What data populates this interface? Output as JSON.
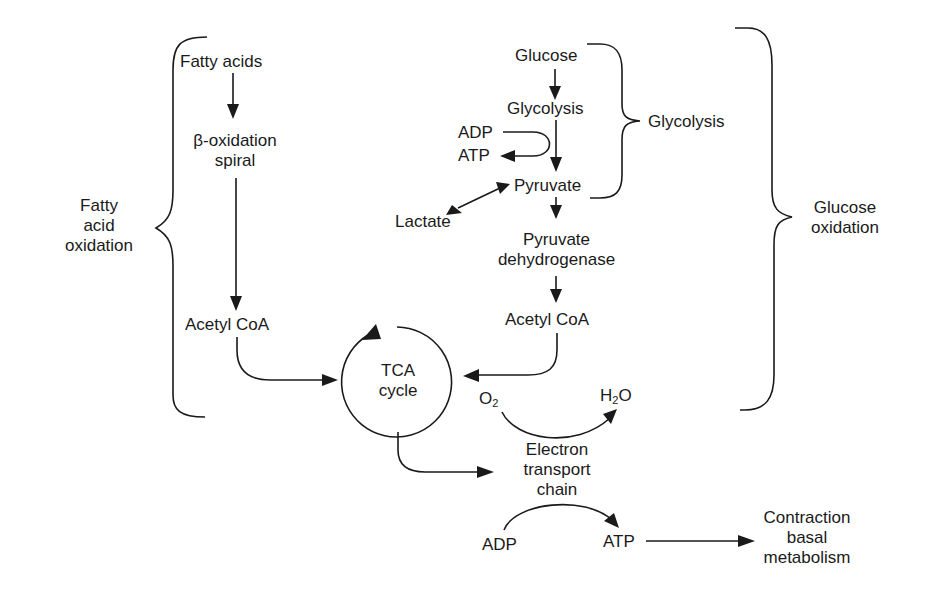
{
  "diagram": {
    "type": "metabolic-pathway",
    "colors": {
      "ink": "#1a1a1a",
      "background": "#ffffff"
    },
    "fatty_acid_branch": {
      "fatty_acids": "Fatty acids",
      "beta_oxidation_1": "β-oxidation",
      "beta_oxidation_2": "spiral",
      "acetyl_coa": "Acetyl CoA",
      "brace_label_1": "Fatty",
      "brace_label_2": "acid",
      "brace_label_3": "oxidation"
    },
    "glucose_branch": {
      "glucose": "Glucose",
      "glycolysis": "Glycolysis",
      "adp": "ADP",
      "atp": "ATP",
      "pyruvate": "Pyruvate",
      "lactate": "Lactate",
      "pdh_1": "Pyruvate",
      "pdh_2": "dehydrogenase",
      "acetyl_coa": "Acetyl CoA",
      "glycolysis_brace_label": "Glycolysis",
      "glucose_ox_label_1": "Glucose",
      "glucose_ox_label_2": "oxidation"
    },
    "tca": {
      "label_1": "TCA",
      "label_2": "cycle"
    },
    "etc": {
      "o2": "O",
      "o2_sub": "2",
      "h2o_h": "H",
      "h2o_sub": "2",
      "h2o_o": "O",
      "label_1": "Electron",
      "label_2": "transport",
      "label_3": "chain",
      "adp": "ADP",
      "atp": "ATP"
    },
    "output": {
      "label_1": "Contraction",
      "label_2": "basal",
      "label_3": "metabolism"
    }
  }
}
